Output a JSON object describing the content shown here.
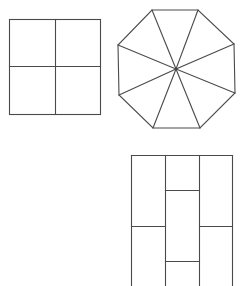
{
  "figure": {
    "stroke_color": "#4a4a4a",
    "background": "#ffffff"
  },
  "shapes": [
    {
      "name": "square-divided-into-four",
      "kind": "square",
      "divisions": "2x2 grid"
    },
    {
      "name": "octagon-divided-into-eight",
      "kind": "regular octagon",
      "divisions": "8 triangles from center"
    },
    {
      "name": "rectangle-brick-pattern",
      "kind": "rectangle",
      "divisions": "3 columns with staggered horizontal splits"
    }
  ]
}
